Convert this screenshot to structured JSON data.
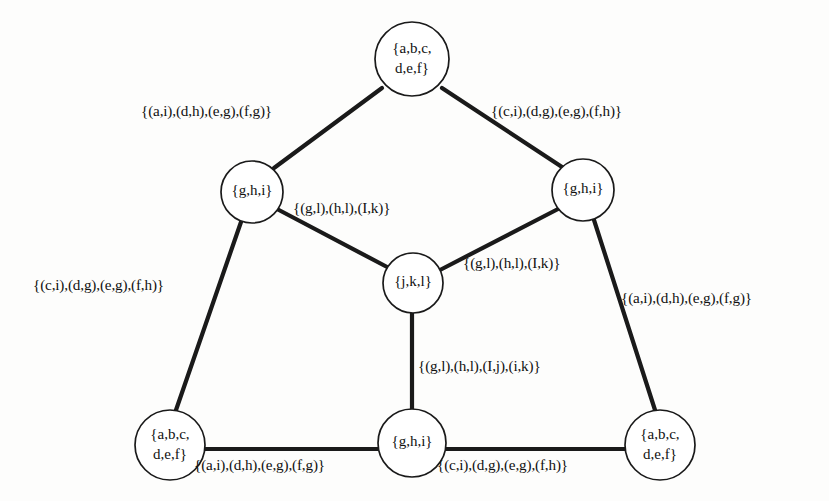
{
  "figure": {
    "type": "graph-diagram",
    "background_color": "#fdfdfc",
    "ink_color": "#111111"
  },
  "nodes": [
    {
      "id": "top",
      "label_line1": "{a,b,c,",
      "label_line2": "d,e,f}",
      "cx": 412,
      "cy": 59,
      "r": 37
    },
    {
      "id": "mid-left",
      "label_line1": "{g,h,i}",
      "label_line2": "",
      "cx": 252,
      "cy": 192,
      "r": 31
    },
    {
      "id": "mid-right",
      "label_line1": "{g,h,i}",
      "label_line2": "",
      "cx": 583,
      "cy": 190,
      "r": 31
    },
    {
      "id": "center",
      "label_line1": "{j,k,l}",
      "label_line2": "",
      "cx": 413,
      "cy": 283,
      "r": 30
    },
    {
      "id": "bottom-left",
      "label_line1": "{a,b,c,",
      "label_line2": "d,e,f}",
      "cx": 170,
      "cy": 445,
      "r": 35
    },
    {
      "id": "bottom-center",
      "label_line1": "{g,h,i}",
      "label_line2": "",
      "cx": 412,
      "cy": 443,
      "r": 34
    },
    {
      "id": "bottom-right",
      "label_line1": "{a,b,c,",
      "label_line2": "d,e,f}",
      "cx": 660,
      "cy": 445,
      "r": 35
    }
  ],
  "edges": [
    {
      "id": "top-to-mid-left",
      "from": "top",
      "to": "mid-left",
      "x1": 382,
      "y1": 88,
      "x2": 274,
      "y2": 168
    },
    {
      "id": "top-to-mid-right",
      "from": "top",
      "to": "mid-right",
      "x1": 442,
      "y1": 88,
      "x2": 562,
      "y2": 167
    },
    {
      "id": "mid-left-to-center",
      "from": "mid-left",
      "to": "center",
      "x1": 277,
      "y1": 209,
      "x2": 389,
      "y2": 268
    },
    {
      "id": "mid-right-to-center",
      "from": "mid-right",
      "to": "center",
      "x1": 560,
      "y1": 208,
      "x2": 440,
      "y2": 270
    },
    {
      "id": "mid-left-to-bottom-left",
      "from": "mid-left",
      "to": "bottom-left",
      "x1": 241,
      "y1": 222,
      "x2": 176,
      "y2": 410
    },
    {
      "id": "mid-right-to-bottom-right",
      "from": "mid-right",
      "to": "bottom-right",
      "x1": 594,
      "y1": 220,
      "x2": 655,
      "y2": 410
    },
    {
      "id": "center-to-bottom-center",
      "from": "center",
      "to": "bottom-center",
      "x1": 412,
      "y1": 313,
      "x2": 412,
      "y2": 409
    },
    {
      "id": "bottom-left-to-center",
      "from": "bottom-left",
      "to": "bottom-center",
      "x1": 205,
      "y1": 449,
      "x2": 378,
      "y2": 449
    },
    {
      "id": "bottom-center-to-right",
      "from": "bottom-center",
      "to": "bottom-right",
      "x1": 446,
      "y1": 449,
      "x2": 625,
      "y2": 449
    }
  ],
  "edge_labels": [
    {
      "id": "label-top-left",
      "for_edge": "top-to-mid-left",
      "text": "{(a,i),(d,h),(e,g),(f,g)}",
      "x": 141,
      "y": 103
    },
    {
      "id": "label-top-right",
      "for_edge": "top-to-mid-right",
      "text": "{(c,i),(d,g),(e,g),(f,h)}",
      "x": 491,
      "y": 103
    },
    {
      "id": "label-mid-left",
      "for_edge": "mid-left-to-center",
      "text": "{(g,l),(h,l),(I,k)}",
      "x": 293,
      "y": 200
    },
    {
      "id": "label-mid-right",
      "for_edge": "mid-right-to-center",
      "text": "{(g,l),(h,l),(I,k)}",
      "x": 463,
      "y": 255
    },
    {
      "id": "label-left-side",
      "for_edge": "mid-left-to-bottom-left",
      "text": "{(c,i),(d,g),(e,g),(f,h)}",
      "x": 33,
      "y": 277
    },
    {
      "id": "label-right-side",
      "for_edge": "mid-right-to-bottom-right",
      "text": "{(a,i),(d,h),(e,g),(f,g)}",
      "x": 621,
      "y": 290
    },
    {
      "id": "label-center-vertical",
      "for_edge": "center-to-bottom-center",
      "text": "{(g,l),(h,l),(I,j),(i,k)}",
      "x": 418,
      "y": 358
    },
    {
      "id": "label-bottom-left",
      "for_edge": "bottom-left-to-center",
      "text": "{(a,i),(d,h),(e,g),(f,g)}",
      "x": 194,
      "y": 457
    },
    {
      "id": "label-bottom-right",
      "for_edge": "bottom-center-to-right",
      "text": "{(c,i),(d,g),(e,g),(f,h)}",
      "x": 437,
      "y": 457
    }
  ]
}
